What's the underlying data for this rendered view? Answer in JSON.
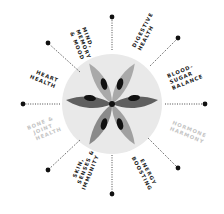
{
  "diagram": {
    "type": "radial-benefits-wheel",
    "center": {
      "x": 112,
      "y": 104
    },
    "colors": {
      "dark": "#1a1a1a",
      "mid": "#6e6e6e",
      "light": "#a8a8a8",
      "circle": "#e9e9e9",
      "faded_text": "#c4c4c4"
    },
    "labels": [
      {
        "id": "mind",
        "lines": [
          "Mind,",
          "Memory",
          "& Mood"
        ],
        "active": true
      },
      {
        "id": "digestive",
        "lines": [
          "Digestive",
          "Health"
        ],
        "active": true
      },
      {
        "id": "blood-sugar",
        "lines": [
          "Blood-",
          "Sugar",
          "Balance"
        ],
        "active": true
      },
      {
        "id": "hormone",
        "lines": [
          "Hormone",
          "Harmony"
        ],
        "active": false
      },
      {
        "id": "energy",
        "lines": [
          "Energy",
          "Boosting"
        ],
        "active": true
      },
      {
        "id": "skin",
        "lines": [
          "Skin,",
          "Senses &",
          "Immunity"
        ],
        "active": true
      },
      {
        "id": "bone",
        "lines": [
          "Bone &",
          "Joint",
          "Health"
        ],
        "active": false
      },
      {
        "id": "heart",
        "lines": [
          "Heart",
          "Health"
        ],
        "active": true
      }
    ]
  }
}
